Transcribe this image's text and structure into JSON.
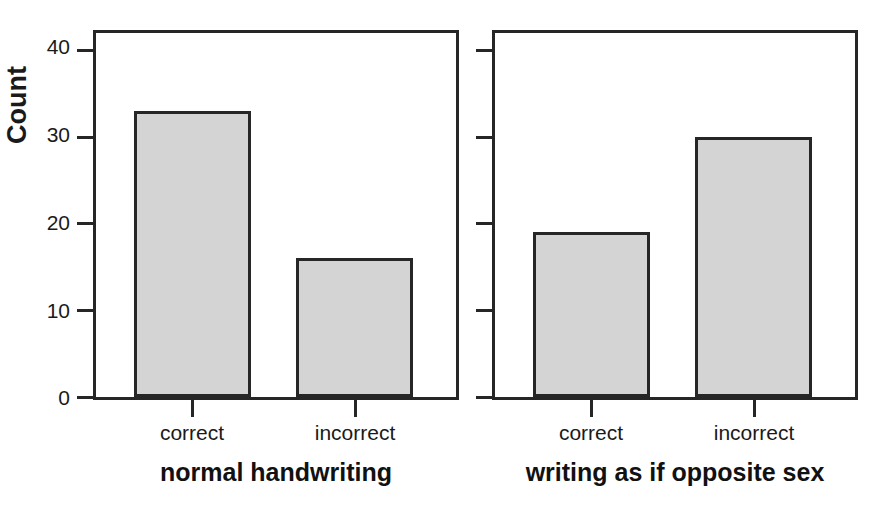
{
  "chart_data": {
    "type": "bar",
    "title": "",
    "subtitle": "",
    "xlabel": "",
    "ylabel": "Count",
    "ylim": [
      0,
      42
    ],
    "yticks": [
      0,
      10,
      20,
      30,
      40
    ],
    "ytick_labels": [
      "0",
      "10",
      "20",
      "30",
      "40"
    ],
    "grid": false,
    "legend": "none",
    "categories": [
      "correct",
      "incorrect"
    ],
    "panels": [
      {
        "name": "normal handwriting",
        "categories": [
          "correct",
          "incorrect"
        ],
        "values": [
          33,
          16
        ],
        "y_axis_labeled": true
      },
      {
        "name": "writing as if opposite sex",
        "categories": [
          "correct",
          "incorrect"
        ],
        "values": [
          19,
          30
        ],
        "y_axis_labeled": false
      }
    ],
    "bar_fill_color": "#d4d4d4",
    "bar_edge_color": "#262626",
    "axis_color": "#262626",
    "background_color": "#ffffff"
  },
  "axis": {
    "y_title": "Count",
    "ticks": [
      {
        "label": "40",
        "value": 40
      },
      {
        "label": "30",
        "value": 30
      },
      {
        "label": "20",
        "value": 20
      },
      {
        "label": "10",
        "value": 10
      },
      {
        "label": "0",
        "value": 0
      }
    ]
  },
  "panel_left": {
    "title": "normal handwriting",
    "bars": [
      {
        "label": "correct",
        "value": 33
      },
      {
        "label": "incorrect",
        "value": 16
      }
    ]
  },
  "panel_right": {
    "title": "writing as if opposite sex",
    "bars": [
      {
        "label": "correct",
        "value": 19
      },
      {
        "label": "incorrect",
        "value": 30
      }
    ]
  }
}
